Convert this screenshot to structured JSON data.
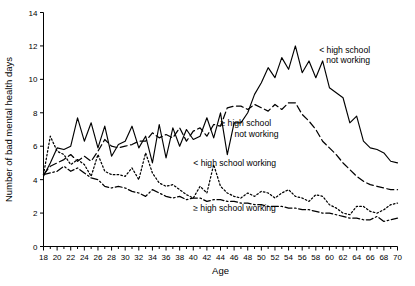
{
  "chart_data": {
    "type": "line",
    "title": "",
    "xlabel": "Age",
    "ylabel": "Number of bad mental health days",
    "xlim": [
      18,
      70
    ],
    "ylim": [
      0,
      14
    ],
    "ytick_step": 2,
    "xtick_step": 2,
    "xtick_minor_step": 1,
    "grid": false,
    "legend_position": "inline-annotations",
    "x": [
      18,
      19,
      20,
      21,
      22,
      23,
      24,
      25,
      26,
      27,
      28,
      29,
      30,
      31,
      32,
      33,
      34,
      35,
      36,
      37,
      38,
      39,
      40,
      41,
      42,
      43,
      44,
      45,
      46,
      47,
      48,
      49,
      50,
      51,
      52,
      53,
      54,
      55,
      56,
      57,
      58,
      59,
      60,
      61,
      62,
      63,
      64,
      65,
      66,
      67,
      68,
      69,
      70
    ],
    "xtick_labels": [
      "18",
      "20",
      "22",
      "24",
      "26",
      "28",
      "30",
      "32",
      "34",
      "36",
      "38",
      "40",
      "42",
      "44",
      "46",
      "48",
      "50",
      "52",
      "54",
      "56",
      "58",
      "60",
      "62",
      "64",
      "66",
      "68",
      "70"
    ],
    "ytick_labels": [
      "0",
      "2",
      "4",
      "6",
      "8",
      "10",
      "12",
      "14"
    ],
    "series": [
      {
        "name": "< high school not working",
        "line_style": "solid",
        "label_x": 58.5,
        "label_y": 11.6,
        "label_anchor": "start",
        "values": [
          4.2,
          5.0,
          5.9,
          5.8,
          6.0,
          7.7,
          6.3,
          7.4,
          5.9,
          7.2,
          5.4,
          6.1,
          6.3,
          7.2,
          5.9,
          6.6,
          5.0,
          7.3,
          5.3,
          7.1,
          6.0,
          7.0,
          6.4,
          6.6,
          7.7,
          6.5,
          8.0,
          5.5,
          7.4,
          7.4,
          8.0,
          9.1,
          9.8,
          10.7,
          10.1,
          11.3,
          10.6,
          12.0,
          10.4,
          11.1,
          10.1,
          11.1,
          9.5,
          9.2,
          8.9,
          7.4,
          7.8,
          6.3,
          5.9,
          5.8,
          5.6,
          5.1,
          5.0
        ]
      },
      {
        "name": "≥ high school not working",
        "line_style": "dashed",
        "label_x": 44.0,
        "label_y": 7.2,
        "label_anchor": "start",
        "values": [
          4.3,
          4.8,
          5.0,
          5.2,
          5.5,
          5.1,
          5.4,
          5.1,
          5.7,
          6.4,
          6.0,
          5.9,
          6.0,
          6.1,
          6.3,
          6.3,
          6.8,
          6.5,
          6.7,
          6.5,
          7.1,
          6.3,
          6.9,
          7.1,
          6.6,
          7.3,
          7.2,
          8.3,
          8.4,
          8.4,
          8.2,
          8.5,
          8.3,
          8.1,
          8.5,
          8.2,
          8.6,
          8.6,
          7.9,
          7.5,
          7.0,
          6.3,
          5.9,
          5.5,
          5.0,
          4.6,
          4.2,
          3.9,
          3.7,
          3.6,
          3.5,
          3.4,
          3.4
        ]
      },
      {
        "name": "< high school working",
        "line_style": "dotted",
        "label_x": 40.0,
        "label_y": 4.8,
        "label_anchor": "start",
        "values": [
          4.3,
          6.6,
          5.7,
          5.5,
          4.9,
          5.2,
          4.9,
          4.2,
          5.5,
          4.5,
          4.3,
          4.3,
          4.2,
          4.7,
          4.0,
          5.6,
          4.4,
          3.8,
          3.6,
          3.7,
          3.4,
          3.1,
          2.9,
          3.6,
          3.2,
          4.9,
          3.6,
          3.2,
          3.0,
          2.9,
          3.2,
          3.0,
          3.3,
          3.2,
          2.9,
          3.2,
          3.4,
          3.0,
          2.9,
          2.7,
          3.1,
          3.0,
          2.5,
          2.3,
          2.0,
          1.9,
          2.4,
          2.4,
          2.1,
          2.0,
          2.2,
          2.5,
          2.6
        ]
      },
      {
        "name": "≥ high school working",
        "line_style": "dashdot",
        "label_x": 40.0,
        "label_y": 2.1,
        "label_anchor": "start",
        "values": [
          4.3,
          4.4,
          4.5,
          4.8,
          4.5,
          4.7,
          4.4,
          4.1,
          4.0,
          3.6,
          3.5,
          3.6,
          3.5,
          3.3,
          3.2,
          3.0,
          3.4,
          3.2,
          3.0,
          2.9,
          3.0,
          2.8,
          2.9,
          2.9,
          2.7,
          2.8,
          2.8,
          2.7,
          2.7,
          2.6,
          2.6,
          2.5,
          2.5,
          2.4,
          2.4,
          2.4,
          2.3,
          2.3,
          2.2,
          2.2,
          2.1,
          2.0,
          2.0,
          1.9,
          1.8,
          1.7,
          1.7,
          1.6,
          1.6,
          1.8,
          1.5,
          1.6,
          1.7
        ]
      }
    ]
  },
  "labels": {
    "series_0": "< high school\nnot working",
    "series_1": "≥ high school\nnot working",
    "series_2": "< high school working",
    "series_3": "≥ high school working",
    "series_0_line1": "< high school",
    "series_0_line2": "not working",
    "series_1_line1": "≥ high school",
    "series_1_line2": "not working"
  },
  "colors": {
    "line": "#000000",
    "axis": "#000000",
    "background": "#ffffff"
  }
}
